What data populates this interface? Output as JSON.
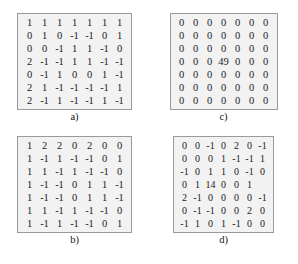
{
  "figure": {
    "background_color": "#ffffff",
    "box_border_color": "#9a9a9a",
    "box_fill_color": "#f2f2f2",
    "text_color": "#1a1a1a"
  },
  "panels": [
    {
      "id": "a",
      "caption": "a)",
      "rows": 7,
      "cols": 7,
      "matrix": [
        [
          "1",
          "1",
          "1",
          "1",
          "1",
          "1",
          "1"
        ],
        [
          "0",
          "1",
          "0",
          "-1",
          "-1",
          "0",
          "1"
        ],
        [
          "0",
          "0",
          "-1",
          "1",
          "1",
          "-1",
          "0"
        ],
        [
          "2",
          "-1",
          "-1",
          "1",
          "1",
          "-1",
          "-1"
        ],
        [
          "0",
          "-1",
          "1",
          "0",
          "0",
          "1",
          "-1"
        ],
        [
          "2",
          "1",
          "-1",
          "-1",
          "-1",
          "-1",
          "1"
        ],
        [
          "2",
          "-1",
          "1",
          "-1",
          "-1",
          "1",
          "-1"
        ]
      ]
    },
    {
      "id": "c",
      "caption": "c)",
      "rows": 7,
      "cols": 7,
      "matrix": [
        [
          "0",
          "0",
          "0",
          "0",
          "0",
          "0",
          "0"
        ],
        [
          "0",
          "0",
          "0",
          "0",
          "0",
          "0",
          "0"
        ],
        [
          "0",
          "0",
          "0",
          "0",
          "0",
          "0",
          "0"
        ],
        [
          "0",
          "0",
          "0",
          "49",
          "0",
          "0",
          "0"
        ],
        [
          "0",
          "0",
          "0",
          "0",
          "0",
          "0",
          "0"
        ],
        [
          "0",
          "0",
          "0",
          "0",
          "0",
          "0",
          "0"
        ],
        [
          "0",
          "0",
          "0",
          "0",
          "0",
          "0",
          "0"
        ]
      ]
    },
    {
      "id": "b",
      "caption": "b)",
      "rows": 7,
      "cols": 7,
      "matrix": [
        [
          "1",
          "2",
          "2",
          "0",
          "2",
          "0",
          "0"
        ],
        [
          "1",
          "-1",
          "1",
          "-1",
          "-1",
          "0",
          "1"
        ],
        [
          "1",
          "1",
          "-1",
          "1",
          "-1",
          "-1",
          "0"
        ],
        [
          "1",
          "-1",
          "-1",
          "0",
          "1",
          "1",
          "-1"
        ],
        [
          "1",
          "-1",
          "-1",
          "0",
          "1",
          "1",
          "-1"
        ],
        [
          "1",
          "1",
          "-1",
          "1",
          "-1",
          "-1",
          "0"
        ],
        [
          "1",
          "-1",
          "1",
          "-1",
          "-1",
          "0",
          "1"
        ]
      ]
    },
    {
      "id": "d",
      "caption": "d)",
      "rows": 7,
      "cols": 7,
      "matrix": [
        [
          "0",
          "0",
          "-1",
          "0",
          "2",
          "0",
          "-1"
        ],
        [
          "0",
          "0",
          "0",
          "1",
          "-1",
          "-1",
          "1"
        ],
        [
          "-1",
          "0",
          "1",
          "1",
          "0",
          "-1",
          "0"
        ],
        [
          "0",
          "1",
          "14",
          "0",
          "0",
          "1",
          ""
        ],
        [
          "2",
          "-1",
          "0",
          "0",
          "0",
          "0",
          "-1"
        ],
        [
          "0",
          "-1",
          "-1",
          "0",
          "0",
          "2",
          "0"
        ],
        [
          "-1",
          "1",
          "0",
          "1",
          "-1",
          "0",
          "0"
        ]
      ]
    }
  ]
}
